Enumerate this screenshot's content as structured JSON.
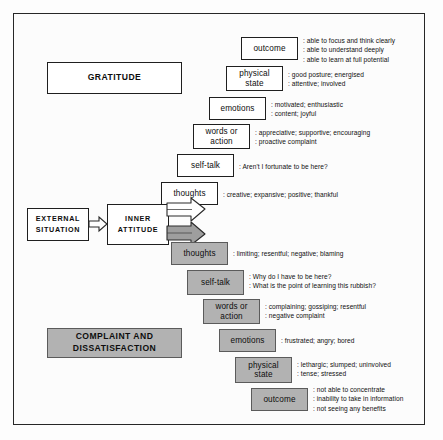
{
  "diagram": {
    "colors": {
      "positive_fill": "#ffffff",
      "negative_fill": "#b2b2b2",
      "border": "#1f1f1f",
      "page_background": "#fcfcfc"
    },
    "flow": {
      "external_situation": "EXTERNAL\nSITUATION",
      "external_situation_line1": "EXTERNAL",
      "external_situation_line2": "SITUATION",
      "inner_attitude_line1": "INNER",
      "inner_attitude_line2": "ATTITUDE",
      "connector_icon": "block-arrow-right"
    },
    "positive": {
      "heading": "GRATITUDE",
      "steps": [
        {
          "label": "thoughts",
          "lines": [
            ": creative;  expansive;  positive;  thankful"
          ]
        },
        {
          "label": "self-talk",
          "lines": [
            ": Aren't I fortunate to be here?"
          ]
        },
        {
          "label": "words or action",
          "label_line1": "words or",
          "label_line2": "action",
          "lines": [
            ": appreciative;  supportive;  encouraging",
            ": proactive complaint"
          ]
        },
        {
          "label": "emotions",
          "lines": [
            ": motivated;  enthusiastic",
            ": content;  joyful"
          ]
        },
        {
          "label": "physical state",
          "label_line1": "physical",
          "label_line2": "state",
          "lines": [
            ": good posture;  energised",
            ": attentive;  involved"
          ]
        },
        {
          "label": "outcome",
          "lines": [
            ": able to focus and think clearly",
            ": able to understand deeply",
            ": able to learn at full potential"
          ]
        }
      ]
    },
    "negative": {
      "heading_line1": "COMPLAINT AND",
      "heading_line2": "DISSATISFACTION",
      "steps": [
        {
          "label": "thoughts",
          "lines": [
            ": limiting;  resentful;  negative;  blaming"
          ]
        },
        {
          "label": "self-talk",
          "lines": [
            ": Why do I have to be here?",
            ": What is the point of learning this rubbish?"
          ]
        },
        {
          "label": "words or action",
          "label_line1": "words or",
          "label_line2": "action",
          "lines": [
            ": complaining;  gossiping;  resentful",
            ": negative complaint"
          ]
        },
        {
          "label": "emotions",
          "lines": [
            ": frustrated;  angry;  bored"
          ]
        },
        {
          "label": "physical state",
          "label_line1": "physical",
          "label_line2": "state",
          "lines": [
            ": lethargic;  slumped;  uninvolved",
            ": tense;  stressed"
          ]
        },
        {
          "label": "outcome",
          "lines": [
            ": not able to concentrate",
            ": inability to take in information",
            ": not seeing any benefits"
          ]
        }
      ]
    }
  }
}
